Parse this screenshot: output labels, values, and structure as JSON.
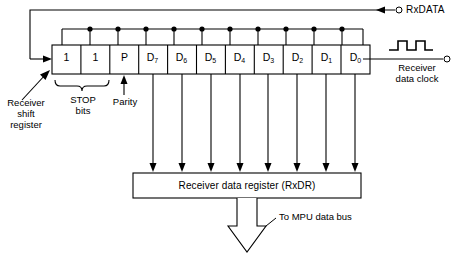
{
  "diagram": {
    "colors": {
      "line": "#000000",
      "background": "#ffffff",
      "fill": "#ffffff"
    }
  },
  "shift_register": {
    "name": "Receiver shift register",
    "label_lines": [
      "Receiver",
      "shift",
      "register"
    ],
    "cells": [
      {
        "id": "stop1",
        "label": "1",
        "sub": ""
      },
      {
        "id": "stop2",
        "label": "1",
        "sub": ""
      },
      {
        "id": "parity",
        "label": "P",
        "sub": ""
      },
      {
        "id": "d7",
        "label": "D",
        "sub": "7"
      },
      {
        "id": "d6",
        "label": "D",
        "sub": "6"
      },
      {
        "id": "d5",
        "label": "D",
        "sub": "5"
      },
      {
        "id": "d4",
        "label": "D",
        "sub": "4"
      },
      {
        "id": "d3",
        "label": "D",
        "sub": "3"
      },
      {
        "id": "d2",
        "label": "D",
        "sub": "2"
      },
      {
        "id": "d1",
        "label": "D",
        "sub": "1"
      },
      {
        "id": "d0",
        "label": "D",
        "sub": "0"
      }
    ]
  },
  "annotations": {
    "stop_bits": {
      "line1": "STOP",
      "line2": "bits"
    },
    "parity": "Parity",
    "rxdata": "RxDATA",
    "receiver_clock": {
      "line1": "Receiver",
      "line2": "data clock"
    },
    "mpu_bus": "To MPU data bus"
  },
  "data_register": {
    "label": "Receiver data register (RxDR)"
  }
}
